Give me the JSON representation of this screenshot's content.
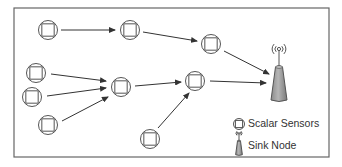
{
  "diagram": {
    "type": "network-topology",
    "frame": {
      "x": 14,
      "y": 8,
      "width": 315,
      "height": 149,
      "stroke": "#666666"
    },
    "colors": {
      "stroke": "#555555",
      "sink_fill": "#999999",
      "sink_fill_light": "#c8c8c8",
      "text": "#333333"
    },
    "nodes": [
      {
        "id": "s1",
        "kind": "scalar-sensor",
        "x": 48,
        "y": 30
      },
      {
        "id": "s2",
        "kind": "scalar-sensor",
        "x": 130,
        "y": 30
      },
      {
        "id": "s3",
        "kind": "scalar-sensor",
        "x": 211,
        "y": 44
      },
      {
        "id": "s4",
        "kind": "scalar-sensor",
        "x": 36,
        "y": 73
      },
      {
        "id": "s5",
        "kind": "scalar-sensor",
        "x": 32,
        "y": 97
      },
      {
        "id": "s6",
        "kind": "scalar-sensor",
        "x": 48,
        "y": 125
      },
      {
        "id": "s7",
        "kind": "scalar-sensor",
        "x": 121,
        "y": 87
      },
      {
        "id": "s8",
        "kind": "scalar-sensor",
        "x": 195,
        "y": 81
      },
      {
        "id": "s9",
        "kind": "scalar-sensor",
        "x": 150,
        "y": 139
      },
      {
        "id": "sink",
        "kind": "sink-node",
        "x": 279,
        "y": 84
      }
    ],
    "edges": [
      {
        "from": "s1",
        "to": "s2",
        "x1": 61,
        "y1": 30,
        "x2": 115,
        "y2": 30
      },
      {
        "from": "s2",
        "to": "s3",
        "x1": 143,
        "y1": 32,
        "x2": 197,
        "y2": 41
      },
      {
        "from": "s3",
        "to": "sink",
        "x1": 224,
        "y1": 51,
        "x2": 269,
        "y2": 74
      },
      {
        "from": "s4",
        "to": "s7",
        "x1": 51,
        "y1": 74,
        "x2": 106,
        "y2": 81
      },
      {
        "from": "s5",
        "to": "s7",
        "x1": 47,
        "y1": 96,
        "x2": 106,
        "y2": 88
      },
      {
        "from": "s6",
        "to": "s7",
        "x1": 62,
        "y1": 121,
        "x2": 108,
        "y2": 97
      },
      {
        "from": "s7",
        "to": "s8",
        "x1": 135,
        "y1": 86,
        "x2": 181,
        "y2": 82
      },
      {
        "from": "s9",
        "to": "s8",
        "x1": 158,
        "y1": 128,
        "x2": 189,
        "y2": 93
      },
      {
        "from": "s8",
        "to": "sink",
        "x1": 210,
        "y1": 81,
        "x2": 266,
        "y2": 83
      }
    ],
    "legend": {
      "items": [
        {
          "icon": "scalar-sensor",
          "label": "Scalar Sensors",
          "icon_x": 239,
          "icon_y": 124
        },
        {
          "icon": "sink-node",
          "label": "Sink Node",
          "icon_x": 239,
          "icon_y": 146
        }
      ]
    }
  }
}
